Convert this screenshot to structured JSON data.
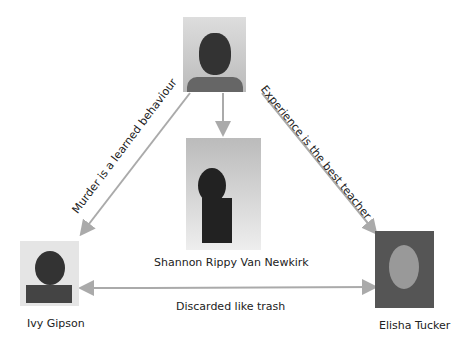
{
  "nodes": {
    "top": {
      "name": "",
      "role": "center-top photo"
    },
    "center": {
      "name": "Shannon Rippy Van Newkirk"
    },
    "left": {
      "name": "Ivy Gipson"
    },
    "right": {
      "name": "Elisha Tucker"
    }
  },
  "edges": {
    "top_to_left": "Murder is a learned behaviour",
    "top_to_right": "Experience is the best teacher",
    "left_right": "Discarded like trash"
  },
  "colors": {
    "arrow": "#aaaaaa"
  }
}
